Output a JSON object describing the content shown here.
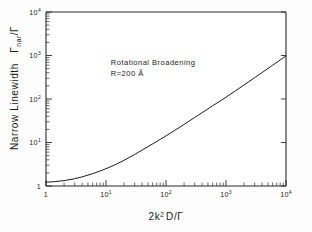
{
  "chart_data": {
    "type": "line",
    "title": "",
    "xlabel": "2k² D/Γ",
    "ylabel": "Narrow Linewidth Γnar/Γ",
    "xscale": "log",
    "yscale": "log",
    "xlim": [
      1,
      10000
    ],
    "ylim": [
      1,
      10000
    ],
    "grid": false,
    "legend": null,
    "xtick_labels": [
      "1",
      "10¹",
      "10²",
      "10³",
      "10⁴"
    ],
    "xtick_values": [
      1,
      10,
      100,
      1000,
      10000
    ],
    "ytick_labels": [
      "1",
      "10¹",
      "10²",
      "10³",
      "10⁴"
    ],
    "ytick_values": [
      1,
      10,
      100,
      1000,
      10000
    ],
    "annotations": [
      {
        "text": "Rotational Broadening",
        "x": 12,
        "y": 620
      },
      {
        "text": "R=200 Å",
        "x": 12,
        "y": 330
      }
    ],
    "series": [
      {
        "name": "rotational broadening",
        "x": [
          1,
          1.4,
          2,
          3,
          4,
          6,
          8,
          10,
          14,
          20,
          30,
          40,
          60,
          80,
          100,
          140,
          200,
          300,
          400,
          600,
          800,
          1000,
          1400,
          2000,
          3000,
          4000,
          6000,
          8000,
          10000
        ],
        "y": [
          1.22,
          1.26,
          1.33,
          1.47,
          1.62,
          1.92,
          2.22,
          2.5,
          3.05,
          3.9,
          5.3,
          6.7,
          9.3,
          11.8,
          14.2,
          19.0,
          26.0,
          37.5,
          48.5,
          70.0,
          90.0,
          110.0,
          150.0,
          210.0,
          310.0,
          405.0,
          600.0,
          790.0,
          980.0
        ]
      }
    ]
  },
  "axis_titles": {
    "y_main": "Narrow Linewidth",
    "y_symbol_base": "Γ",
    "y_symbol_sub": "nar",
    "y_symbol_tail": "/Γ",
    "x_prefix": "2k",
    "x_exp": "2",
    "x_tail": "D/Γ"
  },
  "annotation_lines": {
    "line1": "Rotational Broadening",
    "line2": "R=200 Å"
  },
  "colors": {
    "curve": "#1d1d1d",
    "axis": "#2b2b2b",
    "background": "#fdfdfd",
    "text": "#1a1a1a"
  }
}
